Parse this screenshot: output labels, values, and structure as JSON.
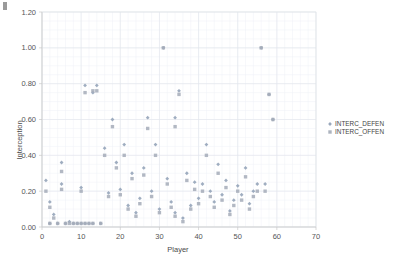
{
  "chart_data": {
    "type": "scatter",
    "title": "",
    "xlabel": "Player",
    "ylabel": "Interception",
    "xlim": [
      0,
      70
    ],
    "ylim": [
      0,
      1.2
    ],
    "xticks": [
      "0",
      "10",
      "20",
      "30",
      "40",
      "50",
      "60",
      "70"
    ],
    "xtick_values": [
      0,
      10,
      20,
      30,
      40,
      50,
      60,
      70
    ],
    "yticks": [
      "0.00",
      "0.20",
      "0.40",
      "0.60",
      "0.80",
      "1.00",
      "1.20"
    ],
    "ytick_values": [
      0,
      0.2,
      0.4,
      0.6,
      0.8,
      1.0,
      1.2
    ],
    "grid": true,
    "grid_minor_x_step": 2,
    "grid_minor_y_step": 0.05,
    "legend_position": "right",
    "series": [
      {
        "name": "INTERC_DEFEN",
        "marker": "diamond",
        "color": "#8e9fb5",
        "points": [
          [
            1,
            0.26
          ],
          [
            2,
            0.14
          ],
          [
            2,
            0.02
          ],
          [
            3,
            0.07
          ],
          [
            4,
            0.02
          ],
          [
            5,
            0.36
          ],
          [
            5,
            0.24
          ],
          [
            6,
            0.02
          ],
          [
            7,
            0.03
          ],
          [
            8,
            0.02
          ],
          [
            9,
            0.02
          ],
          [
            10,
            0.02
          ],
          [
            10,
            0.22
          ],
          [
            11,
            0.79
          ],
          [
            11,
            0.02
          ],
          [
            12,
            0.02
          ],
          [
            13,
            0.75
          ],
          [
            13,
            0.02
          ],
          [
            14,
            0.79
          ],
          [
            15,
            0.02
          ],
          [
            16,
            0.44
          ],
          [
            17,
            0.19
          ],
          [
            18,
            0.6
          ],
          [
            19,
            0.36
          ],
          [
            20,
            0.21
          ],
          [
            21,
            0.46
          ],
          [
            22,
            0.12
          ],
          [
            23,
            0.3
          ],
          [
            24,
            0.08
          ],
          [
            25,
            0.16
          ],
          [
            26,
            0.33
          ],
          [
            27,
            0.61
          ],
          [
            28,
            0.2
          ],
          [
            29,
            0.46
          ],
          [
            30,
            0.1
          ],
          [
            31,
            1.0
          ],
          [
            32,
            0.27
          ],
          [
            33,
            0.14
          ],
          [
            34,
            0.61
          ],
          [
            34,
            0.08
          ],
          [
            35,
            0.76
          ],
          [
            36,
            0.05
          ],
          [
            37,
            0.3
          ],
          [
            38,
            0.12
          ],
          [
            39,
            0.25
          ],
          [
            40,
            0.16
          ],
          [
            41,
            0.24
          ],
          [
            42,
            0.46
          ],
          [
            43,
            0.2
          ],
          [
            44,
            0.14
          ],
          [
            45,
            0.35
          ],
          [
            46,
            0.18
          ],
          [
            47,
            0.26
          ],
          [
            48,
            0.09
          ],
          [
            49,
            0.15
          ],
          [
            50,
            0.23
          ],
          [
            51,
            0.18
          ],
          [
            52,
            0.33
          ],
          [
            53,
            0.13
          ],
          [
            54,
            0.2
          ],
          [
            55,
            0.24
          ],
          [
            56,
            1.0
          ],
          [
            57,
            0.24
          ],
          [
            58,
            0.74
          ],
          [
            59,
            0.6
          ]
        ]
      },
      {
        "name": "INTERC_OFFEN",
        "marker": "square",
        "color": "#a4acb8",
        "points": [
          [
            1,
            0.2
          ],
          [
            2,
            0.11
          ],
          [
            2,
            0.02
          ],
          [
            3,
            0.05
          ],
          [
            4,
            0.02
          ],
          [
            5,
            0.31
          ],
          [
            5,
            0.21
          ],
          [
            6,
            0.02
          ],
          [
            7,
            0.02
          ],
          [
            8,
            0.02
          ],
          [
            9,
            0.02
          ],
          [
            10,
            0.02
          ],
          [
            10,
            0.2
          ],
          [
            11,
            0.75
          ],
          [
            11,
            0.02
          ],
          [
            12,
            0.02
          ],
          [
            13,
            0.76
          ],
          [
            13,
            0.02
          ],
          [
            14,
            0.76
          ],
          [
            15,
            0.02
          ],
          [
            16,
            0.4
          ],
          [
            17,
            0.17
          ],
          [
            18,
            0.56
          ],
          [
            19,
            0.33
          ],
          [
            20,
            0.18
          ],
          [
            21,
            0.4
          ],
          [
            22,
            0.1
          ],
          [
            23,
            0.27
          ],
          [
            24,
            0.06
          ],
          [
            25,
            0.13
          ],
          [
            26,
            0.29
          ],
          [
            27,
            0.55
          ],
          [
            28,
            0.17
          ],
          [
            29,
            0.4
          ],
          [
            30,
            0.08
          ],
          [
            31,
            1.0
          ],
          [
            32,
            0.24
          ],
          [
            33,
            0.11
          ],
          [
            34,
            0.56
          ],
          [
            34,
            0.06
          ],
          [
            35,
            0.74
          ],
          [
            36,
            0.03
          ],
          [
            37,
            0.26
          ],
          [
            38,
            0.1
          ],
          [
            39,
            0.21
          ],
          [
            40,
            0.13
          ],
          [
            41,
            0.2
          ],
          [
            42,
            0.4
          ],
          [
            43,
            0.17
          ],
          [
            44,
            0.11
          ],
          [
            45,
            0.3
          ],
          [
            46,
            0.15
          ],
          [
            47,
            0.22
          ],
          [
            48,
            0.07
          ],
          [
            49,
            0.12
          ],
          [
            50,
            0.2
          ],
          [
            51,
            0.15
          ],
          [
            52,
            0.28
          ],
          [
            53,
            0.1
          ],
          [
            54,
            0.17
          ],
          [
            55,
            0.2
          ],
          [
            56,
            1.0
          ],
          [
            57,
            0.2
          ],
          [
            58,
            0.74
          ],
          [
            59,
            0.6
          ]
        ]
      }
    ]
  },
  "legend": {
    "entries": [
      {
        "label": "INTERC_DEFEN"
      },
      {
        "label": "INTERC_OFFEN"
      }
    ]
  }
}
